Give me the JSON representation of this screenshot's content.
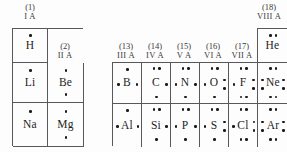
{
  "figure": {
    "type": "periodic-table-lewis-dot-fragment"
  },
  "group_headers": {
    "left": [
      {
        "number": "(1)",
        "roman": "I A"
      },
      {
        "number": "(2)",
        "roman": "II A"
      }
    ],
    "right": [
      {
        "number": "(13)",
        "roman": "III A"
      },
      {
        "number": "(14)",
        "roman": "IV A"
      },
      {
        "number": "(15)",
        "roman": "V A"
      },
      {
        "number": "(16)",
        "roman": "VI A"
      },
      {
        "number": "(17)",
        "roman": "VII A"
      },
      {
        "number": "(18)",
        "roman": "VIII A"
      }
    ]
  },
  "elements": {
    "h": {
      "symbol": "H",
      "valence": 1
    },
    "li": {
      "symbol": "Li",
      "valence": 1
    },
    "be": {
      "symbol": "Be",
      "valence": 2
    },
    "na": {
      "symbol": "Na",
      "valence": 1
    },
    "mg": {
      "symbol": "Mg",
      "valence": 2
    },
    "he": {
      "symbol": "He",
      "valence": 2
    },
    "b": {
      "symbol": "B",
      "valence": 3
    },
    "c": {
      "symbol": "C",
      "valence": 4
    },
    "n": {
      "symbol": "N",
      "valence": 5
    },
    "o": {
      "symbol": "O",
      "valence": 6
    },
    "f": {
      "symbol": "F",
      "valence": 7
    },
    "ne": {
      "symbol": "Ne",
      "valence": 8
    },
    "al": {
      "symbol": "Al",
      "valence": 3
    },
    "si": {
      "symbol": "Si",
      "valence": 4
    },
    "p": {
      "symbol": "P",
      "valence": 5
    },
    "s": {
      "symbol": "S",
      "valence": 6
    },
    "cl": {
      "symbol": "Cl",
      "valence": 7
    },
    "ar": {
      "symbol": "Ar",
      "valence": 8
    }
  },
  "colors": {
    "border": "#58585a",
    "text": "#1e1e1e",
    "dot": "#1a1a1a",
    "background": "#fdfdfd"
  }
}
